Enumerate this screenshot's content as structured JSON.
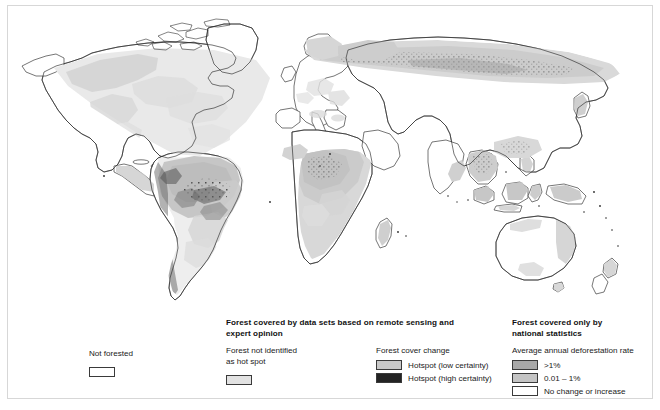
{
  "figure": {
    "kind": "world-choropleth-map"
  },
  "map": {
    "name": "world-forest-cover-map",
    "projection": "equirectangular",
    "background_color": "#ffffff",
    "coastline_color": "#2b2b2b",
    "fill_light": "#ededed",
    "fill_mid": "#cfcfcf",
    "fill_dark": "#9d9d9d",
    "fill_hotspot": "#2a2a2a"
  },
  "legend": {
    "not_forested": {
      "label": "Not forested",
      "swatch_color": "#ffffff"
    },
    "remote_sensing": {
      "title_line1": "Forest covered by data sets based on remote sensing and",
      "title_line2": "expert opinion",
      "not_identified": {
        "label_line1": "Forest not identified",
        "label_line2": "as hot spot",
        "swatch_color": "#e2e2e2"
      },
      "forest_cover_change": {
        "title": "Forest cover change",
        "items": [
          {
            "label": "Hotspot (low certainty)",
            "swatch_color": "#c9c9c9"
          },
          {
            "label": "Hotspot (high certainty)",
            "swatch_color": "#242424"
          }
        ]
      }
    },
    "national_statistics": {
      "title_line1": "Forest covered only by",
      "title_line2": "national statistics",
      "rate_title": "Average annual deforestation rate",
      "items": [
        {
          "label": ">1%",
          "swatch_color": "#a8a8a8"
        },
        {
          "label": "0.01 – 1%",
          "swatch_color": "#c4c4c4"
        },
        {
          "label": "No change or increase",
          "swatch_color": "#ffffff"
        }
      ]
    }
  }
}
